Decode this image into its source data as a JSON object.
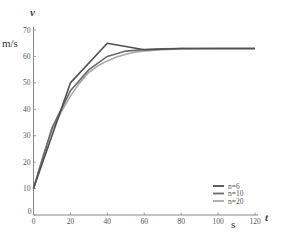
{
  "chart_data": {
    "type": "line",
    "title": "",
    "xlabel": "t",
    "xunit": "s",
    "ylabel": "v",
    "yunit": "m/s",
    "xlim": [
      0,
      120
    ],
    "ylim": [
      0,
      70
    ],
    "xticks": [
      0,
      20,
      40,
      60,
      80,
      100,
      120
    ],
    "yticks": [
      0,
      10,
      20,
      30,
      40,
      50,
      60,
      70
    ],
    "grid": false,
    "legend_position": "lower right",
    "series": [
      {
        "name": "n=6",
        "color": "#505050",
        "x": [
          0,
          20,
          40,
          60,
          80,
          100,
          120
        ],
        "y": [
          10,
          50,
          65,
          62.5,
          63,
          63,
          63
        ]
      },
      {
        "name": "n=10",
        "color": "#6a6a6a",
        "x": [
          0,
          10,
          20,
          30,
          40,
          50,
          60,
          70,
          80,
          90,
          100,
          110,
          120
        ],
        "y": [
          10,
          33,
          47,
          55,
          60,
          62,
          62.6,
          62.9,
          63,
          63,
          63,
          63,
          63
        ]
      },
      {
        "name": "n=20",
        "color": "#a8a8a8",
        "x": [
          0,
          5,
          10,
          15,
          20,
          25,
          30,
          35,
          40,
          45,
          50,
          55,
          60,
          70,
          80,
          90,
          100,
          110,
          120
        ],
        "y": [
          10,
          22,
          32,
          39,
          45,
          50,
          54,
          56.5,
          58.3,
          59.8,
          60.8,
          61.6,
          62.1,
          62.6,
          62.8,
          62.9,
          63,
          63,
          63
        ]
      }
    ]
  },
  "labels": {
    "y_var": "v",
    "y_unit": "m/s",
    "x_var": "t",
    "x_unit": "s"
  }
}
